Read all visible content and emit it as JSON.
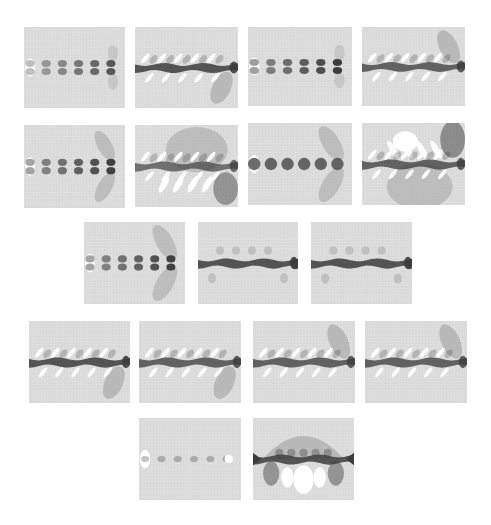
{
  "figure": {
    "background": "#ffffff",
    "colors": {
      "field_bg": "#dcdcdc",
      "grid": "#cfcfcf",
      "dark": "#3c3c3c",
      "mid": "#a9a9a9",
      "light": "#c4c4c4",
      "white": "#ffffff"
    },
    "rows": [
      {
        "panels": [
          {
            "id": "r1p1",
            "x": 24,
            "y": 27,
            "w": 101,
            "h": 81,
            "pattern": "dots-double",
            "intensity": 0.6,
            "lobe": "small-right"
          },
          {
            "id": "r1p2",
            "x": 135,
            "y": 27,
            "w": 103,
            "h": 81,
            "pattern": "band-streaks",
            "intensity": 1.0,
            "lobe": "lower-right"
          },
          {
            "id": "r1p3",
            "x": 248,
            "y": 27,
            "w": 104,
            "h": 79,
            "pattern": "dots-double",
            "intensity": 0.9,
            "lobe": "small-right"
          },
          {
            "id": "r1p4",
            "x": 362,
            "y": 27,
            "w": 103,
            "h": 79,
            "pattern": "band-streaks",
            "intensity": 0.9,
            "lobe": "upper-right"
          }
        ]
      },
      {
        "panels": [
          {
            "id": "r2p1",
            "x": 24,
            "y": 125,
            "w": 101,
            "h": 83,
            "pattern": "dots-double",
            "intensity": 0.85,
            "lobe": "both-right"
          },
          {
            "id": "r2p2",
            "x": 135,
            "y": 125,
            "w": 103,
            "h": 82,
            "pattern": "band-dome-top",
            "intensity": 0.8,
            "lobe": "dome-upper"
          },
          {
            "id": "r2p3",
            "x": 248,
            "y": 123,
            "w": 104,
            "h": 82,
            "pattern": "dots-single-dark",
            "intensity": 1.0,
            "lobe": "both-right-large"
          },
          {
            "id": "r2p4",
            "x": 362,
            "y": 123,
            "w": 103,
            "h": 82,
            "pattern": "band-dome-bottom",
            "intensity": 0.9,
            "lobe": "dome-lower"
          }
        ]
      },
      {
        "panels": [
          {
            "id": "r3p1",
            "x": 84,
            "y": 222,
            "w": 101,
            "h": 82,
            "pattern": "dots-double",
            "intensity": 0.85,
            "lobe": "both-right-large"
          },
          {
            "id": "r3p2",
            "x": 198,
            "y": 222,
            "w": 100,
            "h": 82,
            "pattern": "band-bubbles",
            "intensity": 1.0,
            "lobe": "none"
          },
          {
            "id": "r3p3",
            "x": 311,
            "y": 222,
            "w": 101,
            "h": 82,
            "pattern": "band-bubbles",
            "intensity": 1.0,
            "lobe": "none"
          }
        ]
      },
      {
        "panels": [
          {
            "id": "r4p1",
            "x": 29,
            "y": 321,
            "w": 101,
            "h": 82,
            "pattern": "band-streaks",
            "intensity": 1.0,
            "lobe": "lower-right"
          },
          {
            "id": "r4p2",
            "x": 139,
            "y": 321,
            "w": 102,
            "h": 82,
            "pattern": "band-streaks",
            "intensity": 0.9,
            "lobe": "lower-right"
          },
          {
            "id": "r4p3",
            "x": 253,
            "y": 321,
            "w": 102,
            "h": 82,
            "pattern": "band-streaks",
            "intensity": 0.9,
            "lobe": "upper-right"
          },
          {
            "id": "r4p4",
            "x": 365,
            "y": 321,
            "w": 102,
            "h": 82,
            "pattern": "band-streaks",
            "intensity": 0.9,
            "lobe": "upper-right"
          }
        ]
      },
      {
        "panels": [
          {
            "id": "r5p1",
            "x": 139,
            "y": 418,
            "w": 102,
            "h": 82,
            "pattern": "dots-faint",
            "intensity": 0.4,
            "lobe": "none"
          },
          {
            "id": "r5p2",
            "x": 253,
            "y": 418,
            "w": 101,
            "h": 82,
            "pattern": "band-arch",
            "intensity": 1.0,
            "lobe": "arch"
          }
        ]
      }
    ]
  }
}
